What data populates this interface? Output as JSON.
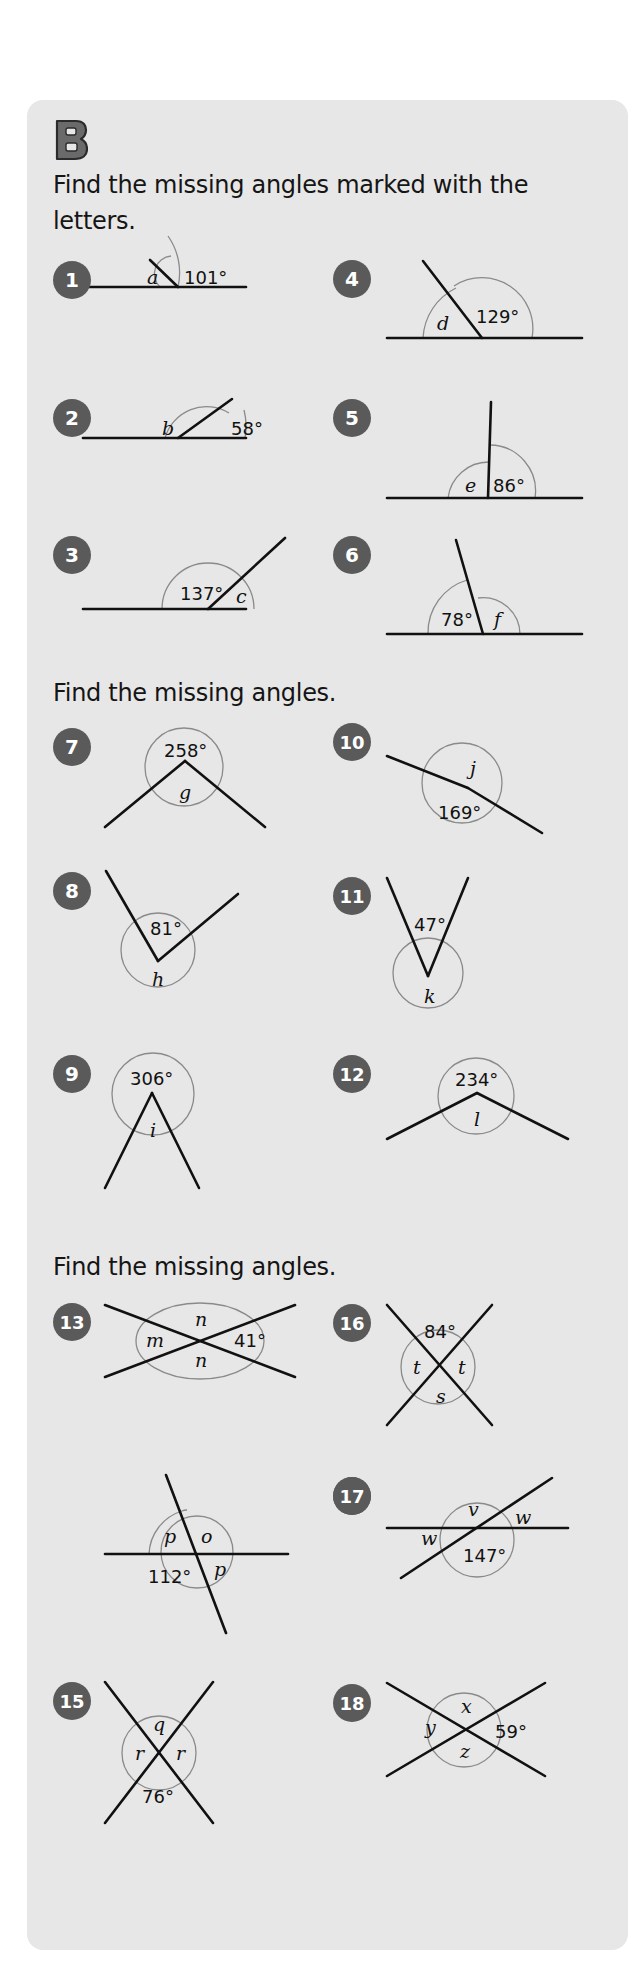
{
  "section": {
    "letter": "B",
    "colors": {
      "panel_bg": "#e7e7e7",
      "badge": "#5a5a5a",
      "line": "#111111",
      "arc": "#8a8a8a",
      "letter_fill": "#6a6a6a"
    }
  },
  "headings": [
    {
      "text_line1": "Find the missing angles marked with the",
      "text_line2": "letters."
    },
    {
      "text": "Find the missing angles."
    },
    {
      "text": "Find the missing angles."
    }
  ],
  "problems": [
    {
      "number": "1",
      "known": "101°",
      "unknown": [
        "a"
      ],
      "type": "angles on a straight line"
    },
    {
      "number": "2",
      "known": "58°",
      "unknown": [
        "b"
      ],
      "type": "angles on a straight line"
    },
    {
      "number": "3",
      "known": "137°",
      "unknown": [
        "c"
      ],
      "type": "angles on a straight line"
    },
    {
      "number": "4",
      "known": "129°",
      "unknown": [
        "d"
      ],
      "type": "angles on a straight line"
    },
    {
      "number": "5",
      "known": "86°",
      "unknown": [
        "e"
      ],
      "type": "angles on a straight line"
    },
    {
      "number": "6",
      "known": "78°",
      "unknown": [
        "f"
      ],
      "type": "angles on a straight line"
    },
    {
      "number": "7",
      "known": "258°",
      "unknown": [
        "g"
      ],
      "type": "angles around a point"
    },
    {
      "number": "8",
      "known": "81°",
      "unknown": [
        "h"
      ],
      "type": "angles around a point"
    },
    {
      "number": "9",
      "known": "306°",
      "unknown": [
        "i"
      ],
      "type": "angles around a point"
    },
    {
      "number": "10",
      "known": "169°",
      "unknown": [
        "j"
      ],
      "type": "angles around a point"
    },
    {
      "number": "11",
      "known": "47°",
      "unknown": [
        "k"
      ],
      "type": "angles around a point"
    },
    {
      "number": "12",
      "known": "234°",
      "unknown": [
        "l"
      ],
      "type": "angles around a point"
    },
    {
      "number": "13",
      "known": "41°",
      "unknown": [
        "m",
        "n",
        "n"
      ],
      "type": "vertically opposite angles"
    },
    {
      "number": "14",
      "known": "112°",
      "unknown": [
        "p",
        "o",
        "p"
      ],
      "type": "vertically opposite angles"
    },
    {
      "number": "15",
      "known": "76°",
      "unknown": [
        "q",
        "r",
        "r"
      ],
      "type": "vertically opposite angles"
    },
    {
      "number": "16",
      "known": "84°",
      "unknown": [
        "t",
        "t",
        "s"
      ],
      "type": "vertically opposite angles"
    },
    {
      "number": "17",
      "known": "147°",
      "unknown": [
        "v",
        "w",
        "w"
      ],
      "type": "vertically opposite angles"
    },
    {
      "number": "18",
      "known": "59°",
      "unknown": [
        "x",
        "y",
        "z"
      ],
      "type": "vertically opposite angles"
    }
  ],
  "figures": [
    {
      "n": "1",
      "badge": [
        72,
        280
      ],
      "lines": [
        [
          83,
          287,
          246,
          287
        ],
        [
          150,
          260,
          178,
          287
        ]
      ],
      "arcs": [
        "M 160 287 A 18 18 0 0 1 171 256",
        "M 178 287 A 64 64 0 0 0 168 236"
      ],
      "labels": [
        {
          "t": "a",
          "x": 147,
          "y": 284,
          "v": true
        },
        {
          "t": "101°",
          "x": 184,
          "y": 284
        }
      ]
    },
    {
      "n": "2",
      "badge": [
        72,
        418
      ],
      "lines": [
        [
          83,
          438,
          246,
          438
        ],
        [
          178,
          438,
          232,
          399
        ]
      ],
      "arcs": [
        "M 165 438 A 43 43 0 0 1 229 413",
        "M 245 438 A 66 66 0 0 0 244 410"
      ],
      "labels": [
        {
          "t": "b",
          "x": 162,
          "y": 435,
          "v": true
        },
        {
          "t": "58°",
          "x": 231,
          "y": 435,
          "label_known": true
        }
      ]
    },
    {
      "n": "3",
      "badge": [
        72,
        555
      ],
      "lines": [
        [
          83,
          609,
          246,
          609
        ],
        [
          208,
          609,
          285,
          538
        ]
      ],
      "arcs": [
        "M 162 609 A 46 46 0 0 1 254 609"
      ],
      "labels": [
        {
          "t": "137°",
          "x": 180,
          "y": 600
        },
        {
          "t": "c",
          "x": 236,
          "y": 603,
          "v": true
        }
      ]
    },
    {
      "n": "4",
      "badge": [
        352,
        279
      ],
      "lines": [
        [
          387,
          338,
          582,
          338
        ],
        [
          423,
          261,
          482,
          338
        ]
      ],
      "arcs": [
        "M 423 338 A 59 59 0 0 1 456 288",
        "M 532 338 A 51 51 0 0 0 454 286"
      ],
      "labels": [
        {
          "t": "d",
          "x": 437,
          "y": 330,
          "v": true
        },
        {
          "t": "129°",
          "x": 476,
          "y": 323
        }
      ]
    },
    {
      "n": "5",
      "badge": [
        352,
        418
      ],
      "lines": [
        [
          387,
          498,
          582,
          498
        ],
        [
          491,
          402,
          488,
          498
        ]
      ],
      "arcs": [
        "M 448 498 A 41 41 0 0 1 489 462",
        "M 535 498 A 46 46 0 0 0 490 445"
      ],
      "labels": [
        {
          "t": "e",
          "x": 465,
          "y": 492,
          "v": true
        },
        {
          "t": "86°",
          "x": 493,
          "y": 492
        }
      ]
    },
    {
      "n": "6",
      "badge": [
        352,
        555
      ],
      "lines": [
        [
          387,
          634,
          582,
          634
        ],
        [
          456,
          540,
          483,
          634
        ]
      ],
      "arcs": [
        "M 428 634 A 55 55 0 0 1 467 580",
        "M 520 634 A 37 37 0 0 0 478 598"
      ],
      "labels": [
        {
          "t": "78°",
          "x": 441,
          "y": 626
        },
        {
          "t": "f",
          "x": 494,
          "y": 626,
          "v": true
        }
      ]
    },
    {
      "n": "7",
      "badge": [
        72,
        747
      ],
      "circle": [
        184,
        767,
        39
      ],
      "lines": [
        [
          105,
          827,
          185,
          761
        ],
        [
          185,
          761,
          265,
          827
        ]
      ],
      "labels": [
        {
          "t": "258°",
          "x": 164,
          "y": 757
        },
        {
          "t": "g",
          "x": 179,
          "y": 799,
          "v": true
        }
      ]
    },
    {
      "n": "8",
      "badge": [
        72,
        891
      ],
      "circle": [
        158,
        950,
        37
      ],
      "lines": [
        [
          106,
          871,
          158,
          961
        ],
        [
          158,
          961,
          238,
          894
        ]
      ],
      "labels": [
        {
          "t": "81°",
          "x": 150,
          "y": 935
        },
        {
          "t": "h",
          "x": 152,
          "y": 986,
          "v": true
        }
      ]
    },
    {
      "n": "9",
      "badge": [
        72,
        1074
      ],
      "circle": [
        153,
        1094,
        41
      ],
      "lines": [
        [
          105,
          1188,
          152,
          1093
        ],
        [
          152,
          1093,
          199,
          1188
        ]
      ],
      "labels": [
        {
          "t": "306°",
          "x": 130,
          "y": 1085
        },
        {
          "t": "i",
          "x": 150,
          "y": 1137,
          "v": true
        }
      ]
    },
    {
      "n": "10",
      "badge": [
        352,
        742
      ],
      "circle": [
        462,
        783,
        40
      ],
      "lines": [
        [
          387,
          756,
          468,
          788
        ],
        [
          468,
          788,
          542,
          833
        ]
      ],
      "labels": [
        {
          "t": "j",
          "x": 470,
          "y": 775,
          "v": true
        },
        {
          "t": "169°",
          "x": 438,
          "y": 819
        }
      ]
    },
    {
      "n": "11",
      "badge": [
        352,
        896
      ],
      "circle": [
        428,
        973,
        35
      ],
      "lines": [
        [
          387,
          878,
          428,
          976
        ],
        [
          428,
          976,
          468,
          878
        ]
      ],
      "labels": [
        {
          "t": "47°",
          "x": 414,
          "y": 931
        },
        {
          "t": "k",
          "x": 424,
          "y": 1003,
          "v": true
        }
      ]
    },
    {
      "n": "12",
      "badge": [
        352,
        1074
      ],
      "circle": [
        476,
        1096,
        38
      ],
      "lines": [
        [
          387,
          1139,
          477,
          1093
        ],
        [
          477,
          1093,
          568,
          1139
        ]
      ],
      "labels": [
        {
          "t": "234°",
          "x": 455,
          "y": 1086
        },
        {
          "t": "l",
          "x": 474,
          "y": 1126,
          "v": true
        }
      ]
    },
    {
      "n": "13",
      "badge": [
        72,
        1322
      ],
      "circle": [
        200,
        1340,
        36
      ],
      "ellipse": [
        200,
        1341,
        64,
        38
      ],
      "lines": [
        [
          105,
          1305,
          295,
          1377
        ],
        [
          105,
          1377,
          295,
          1305
        ]
      ],
      "labels": [
        {
          "t": "n",
          "x": 195,
          "y": 1326,
          "v": true
        },
        {
          "t": "m",
          "x": 146,
          "y": 1347,
          "v": true
        },
        {
          "t": "41°",
          "x": 234,
          "y": 1347
        },
        {
          "t": "n",
          "x": 195,
          "y": 1367,
          "v": true
        }
      ]
    },
    {
      "n": "14",
      "badge": [
        352,
        1496
      ],
      "lines": [
        [
          105,
          1554,
          288,
          1554
        ],
        [
          166,
          1475,
          226,
          1633
        ]
      ],
      "arcs": [
        "M 149 1554 A 47 47 0 0 1 182 1511",
        "M 182 1511 A 10 10 0 0 1 187 1510"
      ],
      "circle": [
        197,
        1552,
        36
      ],
      "labels": [
        {
          "t": "p",
          "x": 164,
          "y": 1543,
          "v": true
        },
        {
          "t": "o",
          "x": 201,
          "y": 1543,
          "v": true
        },
        {
          "t": "112°",
          "x": 148,
          "y": 1583
        },
        {
          "t": "p",
          "x": 214,
          "y": 1576,
          "v": true
        }
      ]
    },
    {
      "n": "15",
      "badge": [
        72,
        1701
      ],
      "circle": [
        159,
        1753,
        37
      ],
      "lines": [
        [
          105,
          1682,
          213,
          1823
        ],
        [
          213,
          1682,
          105,
          1823
        ]
      ],
      "labels": [
        {
          "t": "q",
          "x": 153,
          "y": 1731,
          "v": true
        },
        {
          "t": "r",
          "x": 135,
          "y": 1760,
          "v": true
        },
        {
          "t": "r",
          "x": 176,
          "y": 1760,
          "v": true
        },
        {
          "t": "76°",
          "x": 142,
          "y": 1803
        }
      ]
    },
    {
      "n": "16",
      "badge": [
        352,
        1323
      ],
      "circle": [
        438,
        1367,
        37
      ],
      "lines": [
        [
          387,
          1305,
          492,
          1425
        ],
        [
          492,
          1305,
          387,
          1425
        ]
      ],
      "labels": [
        {
          "t": "84°",
          "x": 424,
          "y": 1338
        },
        {
          "t": "t",
          "x": 413,
          "y": 1374,
          "v": true
        },
        {
          "t": "t",
          "x": 458,
          "y": 1374,
          "v": true
        },
        {
          "t": "s",
          "x": 436,
          "y": 1403,
          "v": true
        }
      ]
    },
    {
      "n": "17",
      "badge": [
        352,
        1496
      ],
      "circle": [
        477,
        1540,
        37
      ],
      "lines": [
        [
          387,
          1528,
          568,
          1528
        ],
        [
          401,
          1578,
          552,
          1478
        ]
      ],
      "labels": [
        {
          "t": "v",
          "x": 468,
          "y": 1516,
          "v": true
        },
        {
          "t": "w",
          "x": 515,
          "y": 1524,
          "v": true
        },
        {
          "t": "w",
          "x": 421,
          "y": 1545,
          "v": true
        },
        {
          "t": "147°",
          "x": 463,
          "y": 1562
        }
      ]
    },
    {
      "n": "18",
      "badge": [
        352,
        1703
      ],
      "circle": [
        464,
        1730,
        37
      ],
      "lines": [
        [
          387,
          1683,
          545,
          1776
        ],
        [
          387,
          1776,
          545,
          1683
        ]
      ],
      "labels": [
        {
          "t": "x",
          "x": 461,
          "y": 1713,
          "v": true
        },
        {
          "t": "y",
          "x": 425,
          "y": 1734,
          "v": true
        },
        {
          "t": "59°",
          "x": 495,
          "y": 1738
        },
        {
          "t": "z",
          "x": 460,
          "y": 1758,
          "v": true
        }
      ]
    }
  ]
}
